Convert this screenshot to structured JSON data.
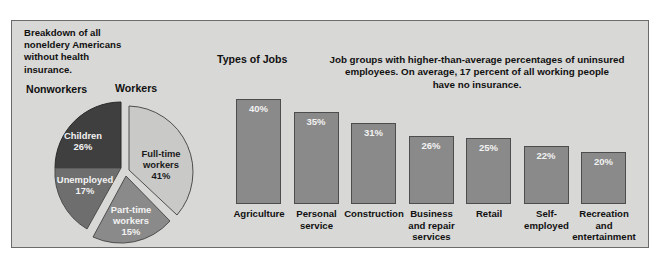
{
  "intro": {
    "lines": [
      "Breakdown of all",
      "noneldery Americans",
      "without health",
      "insurance."
    ]
  },
  "pie_section": {
    "nonworkers_label": "Nonworkers",
    "workers_label": "Workers"
  },
  "bars_section": {
    "title": "Types of Jobs",
    "blurb_lines": [
      "Job groups with higher-than-average percentages of uninsured",
      "employees. On average, 17 percent of all working people",
      "have no insurance."
    ]
  },
  "colors": {
    "panel_background": "#d8d8d6",
    "panel_border": "#6b6b6b",
    "bar_fill": "#8a8a8a",
    "bar_border": "#4d4d4d",
    "pie_children": "#3f3f3f",
    "pie_unemployed": "#6e6e6e",
    "pie_fulltime": "#c9c9c7",
    "pie_parttime": "#8a8a8a",
    "text_dark": "#111111",
    "text_light": "#f2f2f2"
  },
  "chart_data": [
    {
      "type": "pie",
      "title": "Breakdown of all noneldery Americans without health insurance.",
      "group_labels": [
        "Nonworkers",
        "Workers"
      ],
      "categories": [
        "Children",
        "Unemployed",
        "Part-time workers",
        "Full-time workers"
      ],
      "values": [
        26,
        17,
        15,
        41
      ],
      "value_suffix": "%",
      "slices": [
        {
          "name": "Children",
          "value": 26,
          "value_text": "26%",
          "label_lines": [
            "Children",
            "26%"
          ],
          "group": "Nonworkers",
          "color": "#3f3f3f",
          "text_color": "#f2f2f2"
        },
        {
          "name": "Unemployed",
          "value": 17,
          "value_text": "17%",
          "label_lines": [
            "Unemployed",
            "17%"
          ],
          "group": "Nonworkers",
          "color": "#6e6e6e",
          "text_color": "#f2f2f2"
        },
        {
          "name": "Part-time workers",
          "value": 15,
          "value_text": "15%",
          "label_lines": [
            "Part-time",
            "workers",
            "15%"
          ],
          "group": "Workers",
          "color": "#8a8a8a",
          "text_color": "#f2f2f2"
        },
        {
          "name": "Full-time workers",
          "value": 41,
          "value_text": "41%",
          "label_lines": [
            "Full-time",
            "workers",
            "41%"
          ],
          "group": "Workers",
          "color": "#c9c9c7",
          "text_color": "#1a1a1a"
        }
      ],
      "legend_position": "in-slice",
      "grid": false
    },
    {
      "type": "bar",
      "title": "Types of Jobs",
      "subtitle": "Job groups with higher-than-average percentages of uninsured employees. On average, 17 percent of all working people have no insurance.",
      "categories": [
        "Agriculture",
        "Personal service",
        "Construction",
        "Business and repair services",
        "Retail",
        "Self-employed",
        "Recreation and entertainment"
      ],
      "values": [
        40,
        35,
        31,
        26,
        25,
        22,
        20
      ],
      "value_labels": [
        "40%",
        "35%",
        "31%",
        "26%",
        "25%",
        "22%",
        "20%"
      ],
      "bars": [
        {
          "label_lines": [
            "Agriculture"
          ],
          "value": 40,
          "value_text": "40%"
        },
        {
          "label_lines": [
            "Personal",
            "service"
          ],
          "value": 35,
          "value_text": "35%"
        },
        {
          "label_lines": [
            "Construction"
          ],
          "value": 31,
          "value_text": "31%"
        },
        {
          "label_lines": [
            "Business",
            "and repair",
            "services"
          ],
          "value": 26,
          "value_text": "26%"
        },
        {
          "label_lines": [
            "Retail"
          ],
          "value": 25,
          "value_text": "25%"
        },
        {
          "label_lines": [
            "Self-",
            "employed"
          ],
          "value": 22,
          "value_text": "22%"
        },
        {
          "label_lines": [
            "Recreation",
            "and",
            "entertainment"
          ],
          "value": 20,
          "value_text": "20%"
        }
      ],
      "xlabel": "",
      "ylabel": "",
      "ylim": [
        0,
        40
      ],
      "grid": false,
      "legend_position": "none"
    }
  ]
}
